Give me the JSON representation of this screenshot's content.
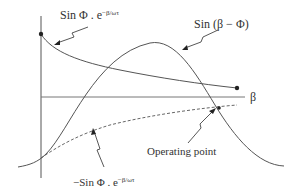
{
  "diagram": {
    "type": "phase-plane sketch",
    "axis": {
      "x_label": "β"
    },
    "curves": [
      {
        "name": "decaying-positive",
        "label_main": "Sin Φ . e",
        "label_exp": "−β/ωτ",
        "style": "solid"
      },
      {
        "name": "sine",
        "label": "Sin (β − Φ)",
        "style": "solid"
      },
      {
        "name": "decaying-negative",
        "label_main": "−Sin Φ . e",
        "label_exp": "−β/ωτ",
        "style": "dashed"
      }
    ],
    "annotations": {
      "operating_point": "Operating point"
    },
    "colors": {
      "line": "#555555",
      "text": "#333333",
      "background": "#ffffff"
    }
  }
}
